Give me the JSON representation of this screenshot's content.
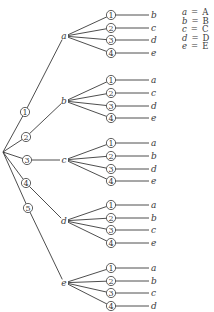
{
  "diagram": {
    "type": "tree",
    "root": {
      "x": 3,
      "y": 152
    },
    "first_level": [
      {
        "index": "1",
        "circle": {
          "x": 25,
          "y": 112
        },
        "node": {
          "label": "a",
          "x": 64,
          "y": 36
        },
        "leaves": [
          {
            "index": "1",
            "label": "b"
          },
          {
            "index": "2",
            "label": "c"
          },
          {
            "index": "3",
            "label": "d"
          },
          {
            "index": "4",
            "label": "e"
          }
        ],
        "leaf_y": [
          15,
          28,
          40,
          53
        ]
      },
      {
        "index": "2",
        "circle": {
          "x": 26,
          "y": 137
        },
        "node": {
          "label": "b",
          "x": 64,
          "y": 101
        },
        "leaves": [
          {
            "index": "1",
            "label": "a"
          },
          {
            "index": "2",
            "label": "c"
          },
          {
            "index": "3",
            "label": "d"
          },
          {
            "index": "4",
            "label": "e"
          }
        ],
        "leaf_y": [
          80,
          93,
          106,
          118
        ]
      },
      {
        "index": "3",
        "circle": {
          "x": 27,
          "y": 160
        },
        "node": {
          "label": "c",
          "x": 64,
          "y": 160
        },
        "leaves": [
          {
            "index": "1",
            "label": "a"
          },
          {
            "index": "2",
            "label": "b"
          },
          {
            "index": "3",
            "label": "d"
          },
          {
            "index": "4",
            "label": "e"
          }
        ],
        "leaf_y": [
          143,
          156,
          169,
          181
        ]
      },
      {
        "index": "4",
        "circle": {
          "x": 26,
          "y": 183
        },
        "node": {
          "label": "d",
          "x": 64,
          "y": 221
        },
        "leaves": [
          {
            "index": "1",
            "label": "a"
          },
          {
            "index": "2",
            "label": "b"
          },
          {
            "index": "3",
            "label": "c"
          },
          {
            "index": "4",
            "label": "e"
          }
        ],
        "leaf_y": [
          205,
          218,
          230,
          243
        ]
      },
      {
        "index": "5",
        "circle": {
          "x": 28,
          "y": 208
        },
        "node": {
          "label": "e",
          "x": 64,
          "y": 283
        },
        "leaves": [
          {
            "index": "1",
            "label": "a"
          },
          {
            "index": "2",
            "label": "b"
          },
          {
            "index": "3",
            "label": "c"
          },
          {
            "index": "4",
            "label": "d"
          }
        ],
        "leaf_y": [
          268,
          281,
          293,
          306
        ]
      }
    ],
    "legend": [
      {
        "var": "a",
        "eq": "=",
        "value": "A"
      },
      {
        "var": "b",
        "eq": "=",
        "value": "B"
      },
      {
        "var": "c",
        "eq": "=",
        "value": "C"
      },
      {
        "var": "d",
        "eq": "=",
        "value": "D"
      },
      {
        "var": "e",
        "eq": "=",
        "value": "E"
      }
    ],
    "colors": {
      "ink": "#3a3a3a",
      "background": "#ffffff"
    }
  }
}
